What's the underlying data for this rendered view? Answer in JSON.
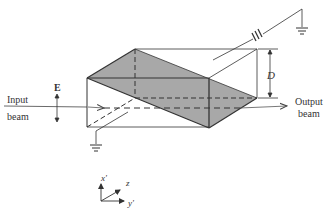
{
  "labels": {
    "input_line1": "Input",
    "input_line2": "beam",
    "output_line1": "Output",
    "output_line2": "beam",
    "field": "E",
    "dimension": "D",
    "axis_x": "x'",
    "axis_z": "z",
    "axis_y": "y'"
  },
  "colors": {
    "ink": "#333333",
    "shade": "#a8a8a8",
    "background": "#ffffff"
  }
}
